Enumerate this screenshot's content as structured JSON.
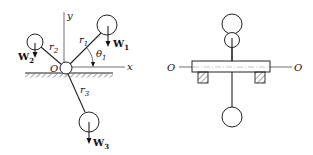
{
  "left_diagram": {
    "axis_x_label": "x",
    "axis_y_label": "y",
    "origin_label": "O",
    "angle_label": "θ",
    "angle_sub": "1",
    "arms": [
      {
        "label": "r",
        "sub": "1"
      },
      {
        "label": "r",
        "sub": "2"
      },
      {
        "label": "r",
        "sub": "3"
      }
    ],
    "weights": [
      {
        "label": "W",
        "sub": "1"
      },
      {
        "label": "W",
        "sub": "2"
      },
      {
        "label": "W",
        "sub": "3"
      }
    ]
  },
  "right_diagram": {
    "axis_left_label": "O",
    "axis_right_label": "O"
  }
}
